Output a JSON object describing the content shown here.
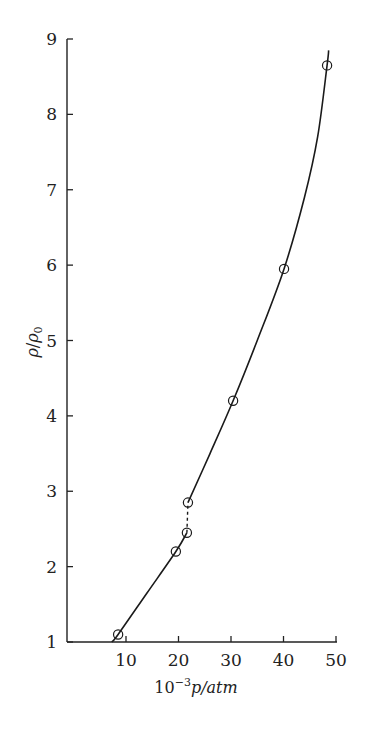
{
  "chart_data": {
    "type": "line",
    "title": "",
    "xlabel": "10^-3 p/atm",
    "ylabel": "ρ/ρ0",
    "xlim": [
      0,
      50
    ],
    "ylim": [
      1,
      9
    ],
    "xticks": [
      10,
      20,
      30,
      40,
      50
    ],
    "yticks": [
      1,
      2,
      3,
      4,
      5,
      6,
      7,
      8,
      9
    ],
    "grid": false,
    "legend": null,
    "series": [
      {
        "name": "measured",
        "marker": "open-circle",
        "points": [
          {
            "x": 8.5,
            "y": 1.1
          },
          {
            "x": 19.5,
            "y": 2.2
          },
          {
            "x": 21.6,
            "y": 2.45
          },
          {
            "x": 21.8,
            "y": 2.85
          },
          {
            "x": 30.4,
            "y": 4.2
          },
          {
            "x": 40.1,
            "y": 5.95
          },
          {
            "x": 48.3,
            "y": 8.65
          }
        ]
      }
    ],
    "curves": [
      {
        "name": "fit-low",
        "style": "solid",
        "points": [
          [
            7.3,
            1.0
          ],
          [
            8.5,
            1.1
          ],
          [
            14,
            1.65
          ],
          [
            19.5,
            2.2
          ],
          [
            21.6,
            2.45
          ]
        ]
      },
      {
        "name": "transition",
        "style": "dashed",
        "points": [
          [
            21.6,
            2.45
          ],
          [
            21.8,
            2.85
          ]
        ]
      },
      {
        "name": "fit-high",
        "style": "solid",
        "points": [
          [
            21.8,
            2.85
          ],
          [
            26,
            3.5
          ],
          [
            30.4,
            4.2
          ],
          [
            35,
            5.0
          ],
          [
            40.1,
            5.95
          ],
          [
            44,
            6.9
          ],
          [
            46.5,
            7.7
          ],
          [
            48.3,
            8.65
          ],
          [
            48.6,
            8.85
          ]
        ]
      }
    ]
  },
  "axes": {
    "x_label_base": "10",
    "x_label_exp": "−3",
    "x_label_rest": "p/atm",
    "y_label_rho": "ρ",
    "y_label_sub": "0",
    "x_tick_labels": [
      "10",
      "20",
      "30",
      "40",
      "50"
    ],
    "y_tick_labels": [
      "1",
      "2",
      "3",
      "4",
      "5",
      "6",
      "7",
      "8",
      "9"
    ]
  }
}
